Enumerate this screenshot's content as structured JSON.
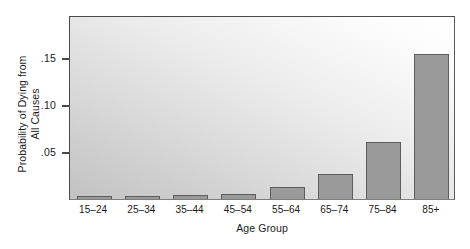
{
  "chart_data": {
    "type": "bar",
    "title": "",
    "xlabel": "Age Group",
    "ylabel": "Probability of Dying from\nAll Causes",
    "categories": [
      "15–24",
      "25–34",
      "35–44",
      "45–54",
      "55–64",
      "65–74",
      "75–84",
      "85+"
    ],
    "values": [
      0.003,
      0.003,
      0.004,
      0.005,
      0.013,
      0.027,
      0.061,
      0.154
    ],
    "ytick_labels": [
      ".05",
      ".10",
      ".15"
    ],
    "ytick_values": [
      0.05,
      0.1,
      0.15
    ],
    "ylim": [
      0,
      0.196
    ],
    "xlim_categories": 8,
    "grid": false,
    "legend": null,
    "colors": {
      "bar_fill": "#9a9a9a",
      "bar_border": "#5d5d5d",
      "frame": "#4a4a4a",
      "panel_light": "#ffffff",
      "panel_dark": "#c2c2c2",
      "text": "#1a1a1a",
      "page_background": "#ffffff"
    }
  }
}
